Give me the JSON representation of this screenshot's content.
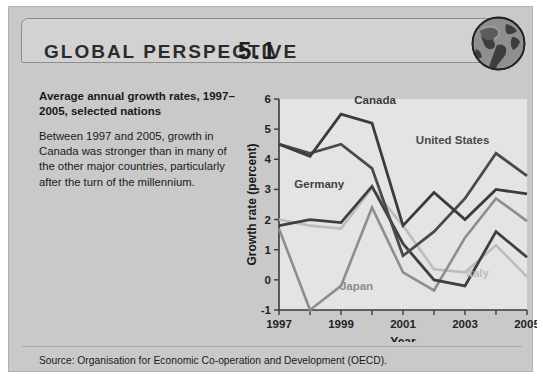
{
  "header": {
    "title": "GLOBAL PERSPECTIVE",
    "number": "5.1",
    "globe_icon": "globe-icon"
  },
  "panel": {
    "lead": "Average annual growth rates, 1997–2005, selected nations",
    "body": "Between 1997 and 2005, growth in Canada was stronger than in many of the other major countries, particularly after the turn of the millennium."
  },
  "footer": {
    "source": "Source: Organisation for Economic Co-operation and Development (OECD)."
  },
  "colors": {
    "card_bg": "#c9c9c9",
    "banner_bg": "#d2d2d2",
    "plot_bg": "#e4e4e4",
    "canada": "#3b3b3b",
    "united_states": "#4a4a4a",
    "germany": "#3f3f3f",
    "japan": "#8d8d8d",
    "italy": "#bdbdbd"
  },
  "chart_data": {
    "type": "line",
    "title": "",
    "xlabel": "Year",
    "ylabel": "Growth rate (percent)",
    "x": [
      1997,
      1998,
      1999,
      2000,
      2001,
      2002,
      2003,
      2004,
      2005
    ],
    "xtick_labels": [
      "1997",
      "",
      "1999",
      "",
      "2001",
      "",
      "2003",
      "",
      "2005"
    ],
    "ytick_labels": [
      "-1",
      "0",
      "1",
      "2",
      "3",
      "4",
      "5",
      "6"
    ],
    "xlim": [
      1997,
      2005
    ],
    "ylim": [
      -1,
      6
    ],
    "grid": false,
    "legend": "inline-annotations",
    "series": [
      {
        "name": "Canada",
        "color": "#3b3b3b",
        "label_x": 2000.1,
        "label_y": 5.85,
        "values": [
          4.5,
          4.1,
          5.5,
          5.2,
          1.8,
          2.9,
          2.0,
          3.0,
          2.85
        ]
      },
      {
        "name": "United States",
        "color": "#4a4a4a",
        "label_x": 2002.6,
        "label_y": 4.5,
        "values": [
          4.5,
          4.2,
          4.5,
          3.7,
          0.8,
          1.6,
          2.7,
          4.2,
          3.45
        ]
      },
      {
        "name": "Germany",
        "color": "#3f3f3f",
        "label_x": 1998.3,
        "label_y": 3.05,
        "values": [
          1.8,
          2.0,
          1.9,
          3.1,
          1.2,
          0.0,
          -0.2,
          1.6,
          0.75
        ]
      },
      {
        "name": "Japan",
        "color": "#8d8d8d",
        "label_x": 1999.5,
        "label_y": -0.35,
        "values": [
          1.7,
          -1.0,
          -0.2,
          2.4,
          0.25,
          -0.35,
          1.4,
          2.7,
          1.95
        ]
      },
      {
        "name": "Italy",
        "color": "#bdbdbd",
        "label_x": 2003.4,
        "label_y": 0.1,
        "values": [
          2.0,
          1.8,
          1.7,
          3.05,
          1.8,
          0.35,
          0.25,
          1.15,
          0.1
        ]
      }
    ]
  }
}
